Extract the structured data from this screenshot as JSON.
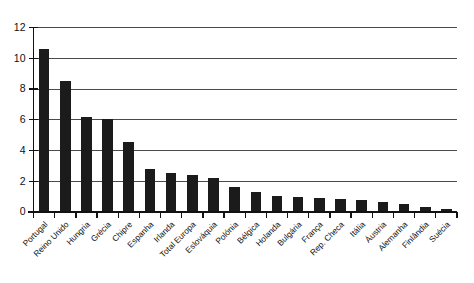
{
  "chart_data": {
    "type": "bar",
    "title": "",
    "subtitle": "",
    "xlabel": "",
    "ylabel": "",
    "ylim": [
      0,
      12
    ],
    "ytick_values": [
      0,
      2,
      4,
      6,
      8,
      10,
      12
    ],
    "ytick_labels": [
      "0",
      "2",
      "4",
      "6",
      "8",
      "10",
      "12"
    ],
    "grid": true,
    "grid_axis": "y",
    "legend": false,
    "legend_position": "none",
    "bar_color": "#1b1b1b",
    "xtick_rotation": 45,
    "categories": [
      "Portugal",
      "Reino Unido",
      "Hungria",
      "Grécia",
      "Chipre",
      "Espanha",
      "Irlanda",
      "Total Europa",
      "Eslováquia",
      "Polónia",
      "Bélgica",
      "Holanda",
      "Bulgária",
      "França",
      "Rep. Checa",
      "Itália",
      "Áustria",
      "Alemanha",
      "Finlândia",
      "Suécia"
    ],
    "values": [
      10.6,
      8.5,
      6.2,
      6.05,
      4.55,
      2.8,
      2.55,
      2.4,
      2.2,
      1.6,
      1.3,
      1.05,
      0.95,
      0.9,
      0.85,
      0.8,
      0.65,
      0.5,
      0.35,
      0.2
    ]
  },
  "colors": {
    "bar": "#1b1b1b",
    "grid": "#4a4a4a",
    "axis": "#111111",
    "background": "#ffffff"
  }
}
